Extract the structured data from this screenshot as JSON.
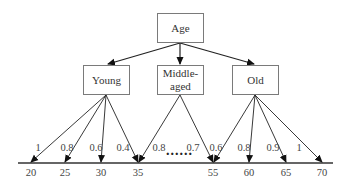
{
  "root": {
    "label": "Age"
  },
  "categories": [
    {
      "id": "young",
      "label": "Young"
    },
    {
      "id": "middle",
      "label": "Middle-\naged",
      "line1": "Middle-",
      "line2": "aged"
    },
    {
      "id": "old",
      "label": "Old"
    }
  ],
  "axis": {
    "ticks": [
      "20",
      "25",
      "30",
      "35",
      "55",
      "60",
      "65",
      "70"
    ],
    "ellipsis": "......"
  },
  "edges": {
    "young": [
      {
        "to": "20",
        "weight": "1"
      },
      {
        "to": "25",
        "weight": "0.8"
      },
      {
        "to": "30",
        "weight": "0.6"
      },
      {
        "to": "35",
        "weight": "0.4"
      }
    ],
    "middle": [
      {
        "to": "35",
        "weight": "0.8"
      },
      {
        "to": "55",
        "weight": "0.7"
      }
    ],
    "old": [
      {
        "to": "55",
        "weight": "0.6"
      },
      {
        "to": "60",
        "weight": "0.8"
      },
      {
        "to": "65",
        "weight": "0.9"
      },
      {
        "to": "70",
        "weight": "1"
      }
    ]
  },
  "colors": {
    "line": "#222222",
    "box_border": "#7a7a7a",
    "text": "#333333"
  }
}
